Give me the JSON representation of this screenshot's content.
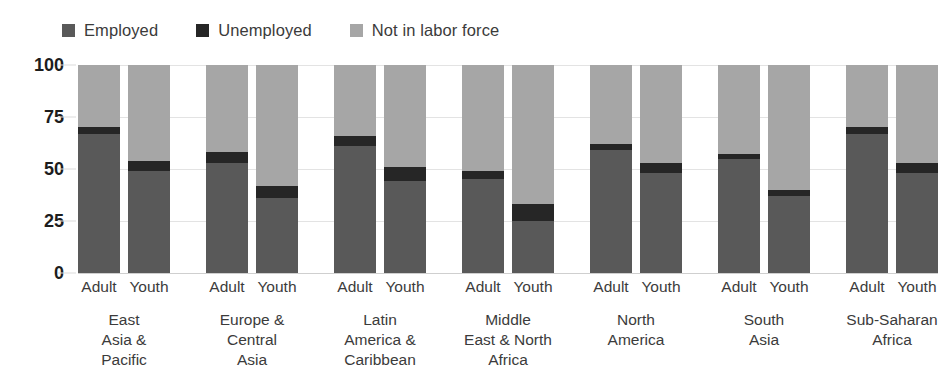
{
  "legend": {
    "items": [
      {
        "label": "Employed",
        "key": "employed",
        "color": "#595959",
        "icon": "square-swatch-icon"
      },
      {
        "label": "Unemployed",
        "key": "unemployed",
        "color": "#262626",
        "icon": "square-swatch-icon"
      },
      {
        "label": "Not in labor force",
        "key": "nilf",
        "color": "#a6a6a6",
        "icon": "square-swatch-icon"
      }
    ]
  },
  "axis": {
    "yticks": [
      "0",
      "25",
      "50",
      "75",
      "100"
    ],
    "ytick_values": [
      0,
      25,
      50,
      75,
      100
    ]
  },
  "chart_data": {
    "type": "bar",
    "subtype": "stacked-grouped-bar",
    "title": "",
    "subtitle": "",
    "xlabel": "",
    "ylabel": "",
    "ylim": [
      0,
      100
    ],
    "grid": true,
    "legend_position": "top-left",
    "stacked": true,
    "stack_order": [
      "Employed",
      "Unemployed",
      "Not in labor force"
    ],
    "series": [
      {
        "name": "Employed",
        "color": "#595959"
      },
      {
        "name": "Unemployed",
        "color": "#262626"
      },
      {
        "name": "Not in labor force",
        "color": "#a6a6a6"
      }
    ],
    "categories": [
      "East Asia & Pacific",
      "Europe & Central Asia",
      "Latin America & Caribbean",
      "Middle East & North Africa",
      "North America",
      "South Asia",
      "Sub-Saharan Africa"
    ],
    "subcategories": [
      "Adult",
      "Youth"
    ],
    "groups": [
      {
        "region": "East Asia & Pacific",
        "region_lines": [
          "East",
          "Asia &",
          "Pacific"
        ],
        "bars": [
          {
            "label": "Adult",
            "employed": 67,
            "unemployed": 3,
            "nilf": 30
          },
          {
            "label": "Youth",
            "employed": 49,
            "unemployed": 5,
            "nilf": 46
          }
        ]
      },
      {
        "region": "Europe & Central Asia",
        "region_lines": [
          "Europe &",
          "Central",
          "Asia"
        ],
        "bars": [
          {
            "label": "Adult",
            "employed": 53,
            "unemployed": 5,
            "nilf": 42
          },
          {
            "label": "Youth",
            "employed": 36,
            "unemployed": 6,
            "nilf": 58
          }
        ]
      },
      {
        "region": "Latin America & Caribbean",
        "region_lines": [
          "Latin",
          "America &",
          "Caribbean"
        ],
        "bars": [
          {
            "label": "Adult",
            "employed": 61,
            "unemployed": 5,
            "nilf": 34
          },
          {
            "label": "Youth",
            "employed": 44,
            "unemployed": 7,
            "nilf": 49
          }
        ]
      },
      {
        "region": "Middle East & North Africa",
        "region_lines": [
          "Middle",
          "East & North",
          "Africa"
        ],
        "bars": [
          {
            "label": "Adult",
            "employed": 45,
            "unemployed": 4,
            "nilf": 51
          },
          {
            "label": "Youth",
            "employed": 25,
            "unemployed": 8,
            "nilf": 67
          }
        ]
      },
      {
        "region": "North America",
        "region_lines": [
          "North",
          "America"
        ],
        "bars": [
          {
            "label": "Adult",
            "employed": 59,
            "unemployed": 3,
            "nilf": 38
          },
          {
            "label": "Youth",
            "employed": 48,
            "unemployed": 5,
            "nilf": 47
          }
        ]
      },
      {
        "region": "South Asia",
        "region_lines": [
          "South",
          "Asia"
        ],
        "bars": [
          {
            "label": "Adult",
            "employed": 55,
            "unemployed": 2,
            "nilf": 43
          },
          {
            "label": "Youth",
            "employed": 37,
            "unemployed": 3,
            "nilf": 60
          }
        ]
      },
      {
        "region": "Sub-Saharan Africa",
        "region_lines": [
          "Sub-Saharan",
          "Africa"
        ],
        "bars": [
          {
            "label": "Adult",
            "employed": 67,
            "unemployed": 3,
            "nilf": 30
          },
          {
            "label": "Youth",
            "employed": 48,
            "unemployed": 5,
            "nilf": 47
          }
        ]
      }
    ]
  }
}
